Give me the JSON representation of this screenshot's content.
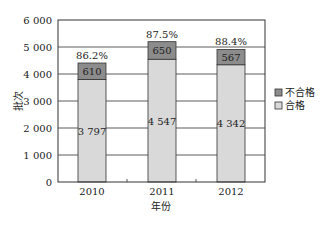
{
  "chart_data": {
    "type": "bar",
    "stacked": true,
    "title": "",
    "xlabel": "年份",
    "ylabel": "批次",
    "categories": [
      "2010",
      "2011",
      "2012"
    ],
    "series": [
      {
        "name": "合格",
        "values": [
          3797,
          4547,
          4342
        ],
        "labels": [
          "3 797",
          "4 547",
          "4 342"
        ],
        "color": "#d9d9d9"
      },
      {
        "name": "不合格",
        "values": [
          610,
          650,
          567
        ],
        "labels": [
          "610",
          "650",
          "567"
        ],
        "color": "#8c8c8c"
      }
    ],
    "annotations": [
      "86.2%",
      "87.5%",
      "88.4%"
    ],
    "ylim": [
      0,
      6000
    ],
    "yticks": [
      0,
      1000,
      2000,
      3000,
      4000,
      5000,
      6000
    ],
    "ytick_labels": [
      "0",
      "1 000",
      "2 000",
      "3 000",
      "4 000",
      "5 000",
      "6 000"
    ],
    "grid": true,
    "legend_position": "right",
    "legend": [
      "不合格",
      "合格"
    ]
  }
}
